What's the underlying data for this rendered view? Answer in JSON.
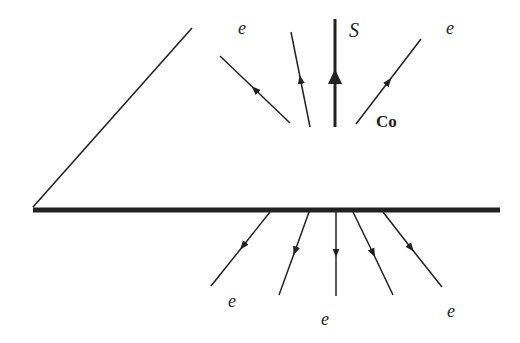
{
  "diagram": {
    "colors": {
      "line": "#222222",
      "background": "#ffffff"
    },
    "surface": {
      "x1": 33,
      "y1": 210,
      "x2": 500,
      "y2": 210,
      "thickness": 5
    },
    "wedge_line": {
      "x1": 33,
      "y1": 207,
      "x2": 192,
      "y2": 28
    },
    "s_line": {
      "x1": 335,
      "y1": 19,
      "x2": 335,
      "y2": 127,
      "arrow_y": 77,
      "label": "S"
    },
    "co_label": "Co",
    "upper_electron_lines": [
      {
        "x1": 290,
        "y1": 123,
        "x2": 220,
        "y2": 56,
        "arrow": "toward-end"
      },
      {
        "x1": 310,
        "y1": 127,
        "x2": 291,
        "y2": 32,
        "arrow": "toward-end"
      },
      {
        "x1": 356,
        "y1": 124,
        "x2": 421,
        "y2": 39,
        "arrow": "toward-end"
      }
    ],
    "lower_electron_lines": [
      {
        "x1": 270,
        "y1": 212,
        "x2": 211,
        "y2": 286,
        "arrow": "toward-end"
      },
      {
        "x1": 309,
        "y1": 212,
        "x2": 279,
        "y2": 295,
        "arrow": "toward-end"
      },
      {
        "x1": 336,
        "y1": 212,
        "x2": 336,
        "y2": 296,
        "arrow": "toward-end"
      },
      {
        "x1": 353,
        "y1": 212,
        "x2": 393,
        "y2": 295,
        "arrow": "toward-end"
      },
      {
        "x1": 383,
        "y1": 212,
        "x2": 442,
        "y2": 287,
        "arrow": "toward-end"
      }
    ],
    "labels": {
      "e_top_left": "e",
      "e_top_right": "e",
      "s": "S",
      "co": "Co",
      "e_bottom_left": "e",
      "e_bottom_middle": "e",
      "e_bottom_right": "e"
    }
  }
}
